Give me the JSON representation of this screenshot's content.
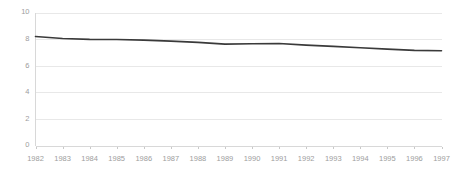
{
  "chart_data": {
    "type": "line",
    "title": "",
    "subtitle": "",
    "xlabel": "",
    "ylabel": "",
    "categories": [
      "1982",
      "1983",
      "1984",
      "1985",
      "1986",
      "1987",
      "1988",
      "1989",
      "1990",
      "1991",
      "1992",
      "1993",
      "1994",
      "1995",
      "1996",
      "1997"
    ],
    "series": [
      {
        "name": "",
        "values": [
          8.2,
          8.05,
          7.98,
          7.97,
          7.92,
          7.85,
          7.75,
          7.62,
          7.65,
          7.67,
          7.55,
          7.45,
          7.35,
          7.25,
          7.15,
          7.12
        ]
      }
    ],
    "x": [
      "1982",
      "1983",
      "1984",
      "1985",
      "1986",
      "1987",
      "1988",
      "1989",
      "1990",
      "1991",
      "1992",
      "1993",
      "1994",
      "1995",
      "1996",
      "1997"
    ],
    "ylim": [
      0,
      10
    ],
    "y_ticks": [
      "0",
      "2",
      "4",
      "6",
      "8",
      "10"
    ],
    "y_tick_values": [
      0,
      2,
      4,
      6,
      8,
      10
    ],
    "grid": true,
    "grid_axis": "y",
    "legend": false,
    "legend_position": "none",
    "annotations": [],
    "colors": {
      "line": "#3a3a3a",
      "gridline": "#e8e8e8",
      "axis": "#d8d8d8",
      "tick_label": "#9d9d9d",
      "background": "#ffffff"
    }
  }
}
